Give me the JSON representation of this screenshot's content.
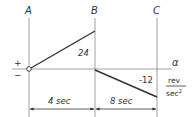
{
  "diagram": {
    "points": {
      "A": "A",
      "B": "B",
      "C": "C"
    },
    "axis": {
      "variable": "α",
      "unit_numerator": "rev",
      "unit_denominator": "sec",
      "unit_exponent": "2",
      "plus_sign": "+",
      "minus_sign": "−"
    },
    "segments": [
      {
        "from": "A",
        "to": "B",
        "start_value": 0,
        "end_value": 24,
        "label": "24"
      },
      {
        "from": "B",
        "to": "C",
        "start_value": 0,
        "end_value": -12,
        "label": "-12"
      }
    ],
    "dimensions": [
      {
        "from": "A",
        "to": "B",
        "label": "4 sec"
      },
      {
        "from": "B",
        "to": "C",
        "label": "8 sec"
      }
    ],
    "colors": {
      "line": "#333333",
      "guide": "#888888"
    }
  }
}
